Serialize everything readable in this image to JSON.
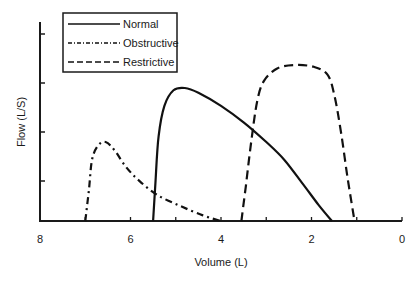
{
  "chart_data": {
    "type": "line",
    "title": "",
    "xlabel": "Volume (L)",
    "ylabel": "Flow (L/S)",
    "xlim": [
      8,
      0
    ],
    "x_reversed": true,
    "x_ticks": [
      8,
      6,
      4,
      2,
      0
    ],
    "x_minor_ticks": [
      7,
      5,
      3,
      1
    ],
    "y_ticks_count": 4,
    "ylim": [
      0,
      4.2
    ],
    "grid": false,
    "legend_position": "top-left",
    "series": [
      {
        "name": "Normal",
        "style": "solid",
        "points": [
          [
            5.5,
            0
          ],
          [
            5.45,
            0.8
          ],
          [
            5.38,
            1.8
          ],
          [
            5.25,
            2.45
          ],
          [
            5.05,
            2.78
          ],
          [
            4.8,
            2.83
          ],
          [
            4.5,
            2.73
          ],
          [
            4.0,
            2.45
          ],
          [
            3.5,
            2.1
          ],
          [
            3.0,
            1.68
          ],
          [
            2.6,
            1.3
          ],
          [
            2.2,
            0.8
          ],
          [
            1.85,
            0.35
          ],
          [
            1.55,
            0
          ]
        ]
      },
      {
        "name": "Obstructive",
        "style": "dash-dot",
        "points": [
          [
            7.0,
            0
          ],
          [
            6.92,
            0.65
          ],
          [
            6.85,
            1.3
          ],
          [
            6.72,
            1.6
          ],
          [
            6.55,
            1.68
          ],
          [
            6.35,
            1.5
          ],
          [
            6.1,
            1.15
          ],
          [
            5.8,
            0.85
          ],
          [
            5.4,
            0.55
          ],
          [
            4.9,
            0.32
          ],
          [
            4.4,
            0.12
          ],
          [
            4.0,
            0
          ]
        ]
      },
      {
        "name": "Restrictive",
        "style": "dashed",
        "points": [
          [
            3.55,
            0
          ],
          [
            3.45,
            0.75
          ],
          [
            3.33,
            1.7
          ],
          [
            3.2,
            2.55
          ],
          [
            3.05,
            2.98
          ],
          [
            2.75,
            3.25
          ],
          [
            2.35,
            3.32
          ],
          [
            1.95,
            3.28
          ],
          [
            1.65,
            3.12
          ],
          [
            1.5,
            2.7
          ],
          [
            1.35,
            1.9
          ],
          [
            1.2,
            0.9
          ],
          [
            1.05,
            0
          ]
        ]
      }
    ]
  },
  "legend": {
    "items": [
      {
        "label": "Normal",
        "style": "solid"
      },
      {
        "label": "Obstructive",
        "style": "dash-dot"
      },
      {
        "label": "Restrictive",
        "style": "dashed"
      }
    ]
  },
  "axes": {
    "x_title": "Volume (L)",
    "y_title": "Flow (L/S)",
    "x_tick_labels": [
      "8",
      "6",
      "4",
      "2",
      "0"
    ]
  },
  "colors": {
    "line": "#111111",
    "axis": "#1a1a1a",
    "background": "#ffffff"
  }
}
